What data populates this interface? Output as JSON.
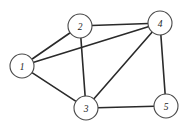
{
  "figure": {
    "background_color": "#ffffff",
    "width": 190,
    "height": 126
  },
  "style": {
    "edge_color": "#2a2a2a",
    "edge_width": 1.6,
    "node_fill": "#ffffff",
    "node_stroke": "#4a4a4a",
    "node_stroke_width": 1.1,
    "label_color": "#1c1c1c",
    "node_radius": 12
  },
  "chart_data": {
    "type": "diagram",
    "subtype": "node-link-graph",
    "directed": false,
    "weighted": false,
    "title": "",
    "xlabel": "",
    "ylabel": "",
    "grid": false,
    "legend": null,
    "node_count": 5,
    "edge_count": 8,
    "nodes": [
      {
        "id": "1",
        "label": "1",
        "x": 22,
        "y": 66,
        "r": 12,
        "degree": 3
      },
      {
        "id": "2",
        "label": "2",
        "x": 80,
        "y": 26,
        "r": 12,
        "degree": 3
      },
      {
        "id": "3",
        "label": "3",
        "x": 86,
        "y": 108,
        "r": 12,
        "degree": 4
      },
      {
        "id": "4",
        "label": "4",
        "x": 160,
        "y": 23,
        "r": 12,
        "degree": 4
      },
      {
        "id": "5",
        "label": "5",
        "x": 166,
        "y": 106,
        "r": 12,
        "degree": 2
      }
    ],
    "edges": [
      {
        "source": "1",
        "target": "2"
      },
      {
        "source": "1",
        "target": "3"
      },
      {
        "source": "1",
        "target": "4"
      },
      {
        "source": "2",
        "target": "3"
      },
      {
        "source": "2",
        "target": "4"
      },
      {
        "source": "3",
        "target": "4"
      },
      {
        "source": "3",
        "target": "5"
      },
      {
        "source": "4",
        "target": "5"
      }
    ],
    "adjacency": {
      "1": [
        "2",
        "3",
        "4"
      ],
      "2": [
        "1",
        "3",
        "4"
      ],
      "3": [
        "1",
        "2",
        "4",
        "5"
      ],
      "4": [
        "1",
        "2",
        "3",
        "5"
      ],
      "5": [
        "3",
        "4"
      ]
    }
  }
}
